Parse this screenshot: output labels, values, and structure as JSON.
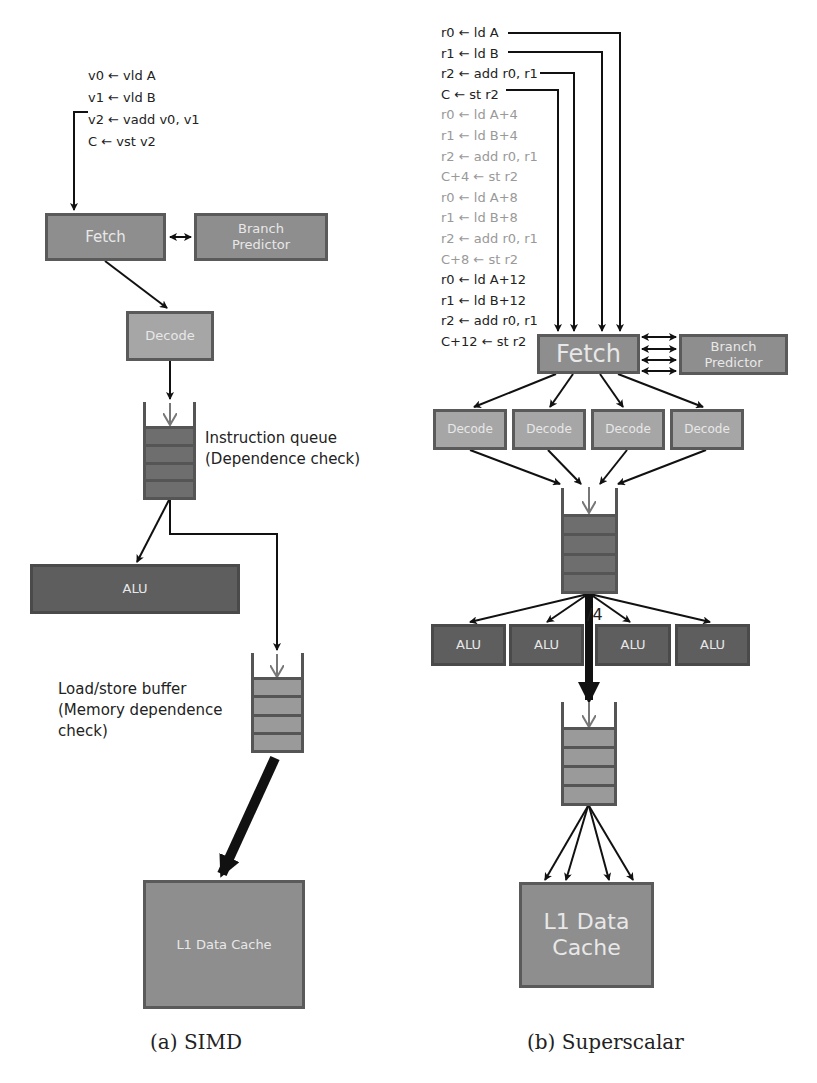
{
  "simd": {
    "code": [
      "v0 ← vld A",
      "v1 ← vld B",
      "v2 ← vadd v0, v1",
      "C ← vst v2"
    ],
    "fetch": "Fetch",
    "branch_predictor": "Branch Predictor",
    "decode": "Decode",
    "iq_label_1": "Instruction queue",
    "iq_label_2": "(Dependence check)",
    "alu": "ALU",
    "lsq_label_1": "Load/store buffer",
    "lsq_label_2": "(Memory dependence",
    "lsq_label_3": "check)",
    "l1": "L1 Data Cache",
    "caption": "(a) SIMD"
  },
  "superscalar": {
    "code": [
      {
        "text": "r0 ← ld A",
        "dim": false
      },
      {
        "text": "r1 ← ld B",
        "dim": false
      },
      {
        "text": "r2 ← add r0, r1",
        "dim": false
      },
      {
        "text": "C ← st r2",
        "dim": false
      },
      {
        "text": "r0 ← ld A+4",
        "dim": true
      },
      {
        "text": "r1 ← ld B+4",
        "dim": true
      },
      {
        "text": "r2 ← add r0, r1",
        "dim": true
      },
      {
        "text": "C+4 ← st r2",
        "dim": true
      },
      {
        "text": "r0 ← ld A+8",
        "dim": true
      },
      {
        "text": "r1 ← ld B+8",
        "dim": true
      },
      {
        "text": "r2 ← add r0, r1",
        "dim": true
      },
      {
        "text": "C+8 ← st r2",
        "dim": true
      },
      {
        "text": "r0 ← ld A+12",
        "dim": false
      },
      {
        "text": "r1 ← ld B+12",
        "dim": false
      },
      {
        "text": "r2 ← add r0, r1",
        "dim": false
      },
      {
        "text": "C+12 ← st r2",
        "dim": false
      }
    ],
    "fetch": "Fetch",
    "branch_predictor": "Branch Predictor",
    "decoders": [
      "Decode",
      "Decode",
      "Decode",
      "Decode"
    ],
    "alus": [
      "ALU",
      "ALU",
      "ALU",
      "ALU"
    ],
    "width_label": "/4",
    "l1_line1": "L1 Data",
    "l1_line2": "Cache",
    "caption": "(b) Superscalar"
  }
}
